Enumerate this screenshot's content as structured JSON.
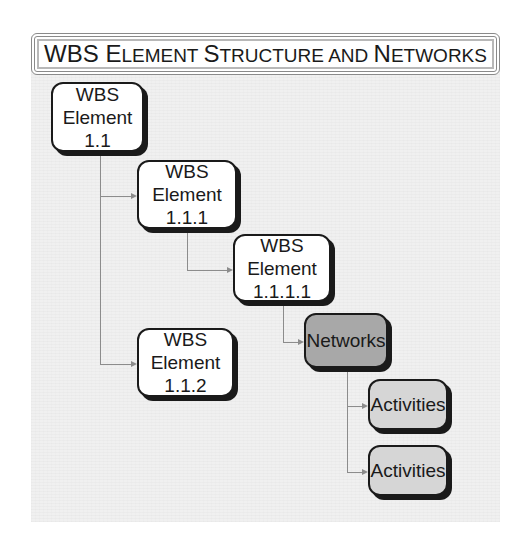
{
  "title": {
    "full": "WBS Element Structure and Networks",
    "parts": [
      {
        "text": "WBS ",
        "style": "cap"
      },
      {
        "text": "E",
        "style": "cap"
      },
      {
        "text": "LEMENT ",
        "style": "sc"
      },
      {
        "text": "S",
        "style": "cap"
      },
      {
        "text": "TRUCTURE AND ",
        "style": "sc"
      },
      {
        "text": "N",
        "style": "cap"
      },
      {
        "text": "ETWORKS",
        "style": "sc"
      }
    ]
  },
  "colors": {
    "white_node": "#ffffff",
    "network_node": "#a8a8a8",
    "activity_node": "#d6d6d6",
    "border": "#1a1a1a",
    "connector": "#8c8c8c",
    "panel_bg": "#f0f0f0"
  },
  "nodes": [
    {
      "id": "wbs-1-1",
      "lines": [
        "WBS",
        "Element",
        "1.1"
      ],
      "fill": "white"
    },
    {
      "id": "wbs-1-1-1",
      "lines": [
        "WBS",
        "Element",
        "1.1.1"
      ],
      "fill": "white"
    },
    {
      "id": "wbs-1-1-1-1",
      "lines": [
        "WBS",
        "Element",
        "1.1.1.1"
      ],
      "fill": "white"
    },
    {
      "id": "networks",
      "lines": [
        "Networks"
      ],
      "fill": "dark"
    },
    {
      "id": "wbs-1-1-2",
      "lines": [
        "WBS",
        "Element",
        "1.1.2"
      ],
      "fill": "white"
    },
    {
      "id": "activities-1",
      "lines": [
        "Activities"
      ],
      "fill": "light"
    },
    {
      "id": "activities-2",
      "lines": [
        "Activities"
      ],
      "fill": "light"
    }
  ],
  "edges": [
    {
      "from": "wbs-1-1",
      "to": "wbs-1-1-1"
    },
    {
      "from": "wbs-1-1",
      "to": "wbs-1-1-2"
    },
    {
      "from": "wbs-1-1-1",
      "to": "wbs-1-1-1-1"
    },
    {
      "from": "wbs-1-1-1-1",
      "to": "networks"
    },
    {
      "from": "networks",
      "to": "activities-1"
    },
    {
      "from": "networks",
      "to": "activities-2"
    }
  ]
}
